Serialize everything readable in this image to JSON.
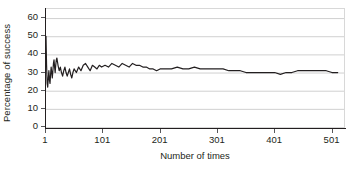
{
  "chart_data": {
    "type": "line",
    "title": "",
    "xlabel": "Number of times",
    "ylabel": "Percentage of success",
    "xlim": [
      1,
      521
    ],
    "ylim": [
      0,
      65
    ],
    "grid": true,
    "legend": null,
    "y_ticks": [
      0,
      10,
      20,
      30,
      40,
      50,
      60
    ],
    "y_tick_labels": [
      "0",
      "10",
      "20",
      "30",
      "40",
      "50",
      "60"
    ],
    "x_ticks": [
      1,
      101,
      201,
      301,
      401,
      501
    ],
    "x_tick_labels": [
      "1",
      "101",
      "201",
      "301",
      "401",
      "501"
    ],
    "line_color": "#231f20",
    "series": [
      {
        "name": "Cumulative percentage of success",
        "x": [
          1,
          2,
          3,
          4,
          5,
          6,
          7,
          8,
          9,
          10,
          11,
          12,
          13,
          14,
          15,
          16,
          17,
          18,
          19,
          20,
          22,
          24,
          26,
          28,
          30,
          32,
          34,
          36,
          38,
          40,
          42,
          44,
          46,
          48,
          50,
          54,
          58,
          62,
          66,
          70,
          74,
          78,
          82,
          86,
          90,
          94,
          98,
          104,
          110,
          116,
          122,
          128,
          134,
          140,
          146,
          152,
          158,
          164,
          170,
          176,
          182,
          188,
          194,
          200,
          210,
          220,
          230,
          240,
          250,
          260,
          270,
          280,
          290,
          300,
          310,
          320,
          330,
          340,
          350,
          360,
          370,
          380,
          390,
          400,
          410,
          420,
          430,
          440,
          450,
          460,
          470,
          480,
          490,
          500,
          510
        ],
        "values": [
          50,
          34,
          24,
          22,
          27,
          31,
          26,
          24,
          29,
          33,
          30,
          27,
          31,
          35,
          37,
          33,
          30,
          34,
          37,
          38,
          34,
          31,
          33,
          30,
          28,
          31,
          33,
          30,
          28,
          30,
          32,
          29,
          27,
          30,
          32,
          30,
          33,
          31,
          34,
          35,
          33,
          31,
          34,
          33,
          32,
          34,
          33,
          34,
          33,
          35,
          34,
          33,
          35,
          34,
          33,
          35,
          34,
          34,
          33,
          33,
          32,
          32,
          31,
          32,
          32,
          32,
          33,
          32,
          32,
          33,
          32,
          32,
          32,
          32,
          32,
          31,
          31,
          31,
          30,
          30,
          30,
          30,
          30,
          30,
          29,
          30,
          30,
          31,
          31,
          31,
          31,
          31,
          31,
          30,
          30
        ]
      }
    ]
  }
}
